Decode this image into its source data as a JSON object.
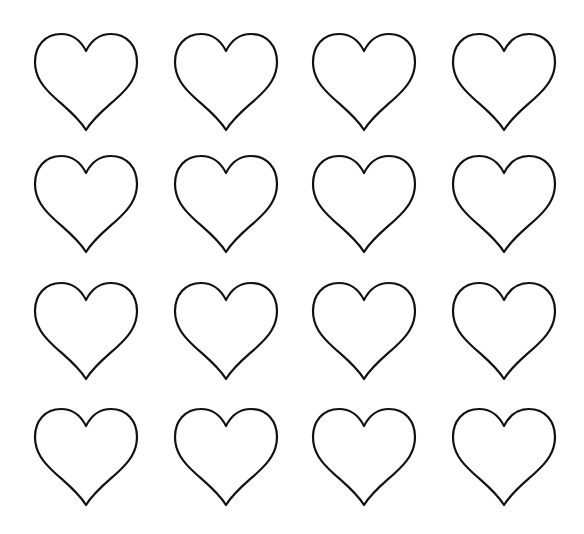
{
  "page": {
    "background": "#ffffff",
    "outline_color": "#111111"
  },
  "grid": {
    "rows": 4,
    "cols": 4,
    "col_left": [
      33,
      173,
      311,
      451
    ],
    "row_top": [
      31,
      153,
      280,
      406
    ]
  },
  "hearts": [
    {
      "row": 0,
      "col": 0,
      "icon": "heart-outline-icon"
    },
    {
      "row": 0,
      "col": 1,
      "icon": "heart-outline-icon"
    },
    {
      "row": 0,
      "col": 2,
      "icon": "heart-outline-icon"
    },
    {
      "row": 0,
      "col": 3,
      "icon": "heart-outline-icon"
    },
    {
      "row": 1,
      "col": 0,
      "icon": "heart-outline-icon"
    },
    {
      "row": 1,
      "col": 1,
      "icon": "heart-outline-icon"
    },
    {
      "row": 1,
      "col": 2,
      "icon": "heart-outline-icon"
    },
    {
      "row": 1,
      "col": 3,
      "icon": "heart-outline-icon"
    },
    {
      "row": 2,
      "col": 0,
      "icon": "heart-outline-icon"
    },
    {
      "row": 2,
      "col": 1,
      "icon": "heart-outline-icon"
    },
    {
      "row": 2,
      "col": 2,
      "icon": "heart-outline-icon"
    },
    {
      "row": 2,
      "col": 3,
      "icon": "heart-outline-icon"
    },
    {
      "row": 3,
      "col": 0,
      "icon": "heart-outline-icon"
    },
    {
      "row": 3,
      "col": 1,
      "icon": "heart-outline-icon"
    },
    {
      "row": 3,
      "col": 2,
      "icon": "heart-outline-icon"
    },
    {
      "row": 3,
      "col": 3,
      "icon": "heart-outline-icon"
    }
  ]
}
